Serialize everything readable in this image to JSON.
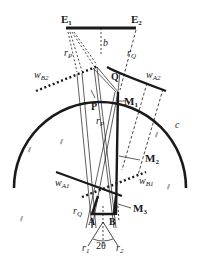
{
  "diagram": {
    "colors": {
      "ink": "#1a1a1a",
      "background": "#ffffff"
    },
    "points": {
      "E1": "E",
      "E1_sub": "1",
      "E2": "E",
      "E2_sub": "2",
      "Q": "Q",
      "P": "P",
      "A": "A",
      "B": "B",
      "M1": "M",
      "M1_sub": "1",
      "M2": "M",
      "M2_sub": "2",
      "M3": "M",
      "M3_sub": "3"
    },
    "labels": {
      "b": "b",
      "c": "c",
      "rP_top": "r",
      "rP_top_sub": "P",
      "rQ_top": "r",
      "rQ_top_sub": "Q",
      "rP_mid": "r",
      "rP_mid_sub": "P",
      "rQ_bot": "r",
      "rQ_bot_sub": "Q",
      "r1": "r",
      "r1_sub": "1",
      "r2": "r",
      "r2_sub": "2",
      "angle": "2θ",
      "wA1": "w",
      "wA1_sub": "A1",
      "wA2": "w",
      "wA2_sub": "A2",
      "wB1": "w",
      "wB1_sub": "B1",
      "wB2": "w",
      "wB2_sub": "B2",
      "parallel_mark": "⫽"
    }
  }
}
